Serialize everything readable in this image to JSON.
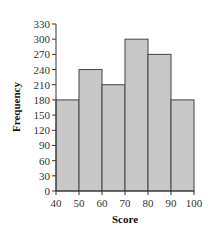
{
  "chart_data": {
    "type": "bar",
    "subtype": "histogram",
    "title": "",
    "xlabel": "Score",
    "ylabel": "Frequency",
    "bins": [
      [
        40,
        50
      ],
      [
        50,
        60
      ],
      [
        60,
        70
      ],
      [
        70,
        80
      ],
      [
        80,
        90
      ],
      [
        90,
        100
      ]
    ],
    "categories": [
      "40-50",
      "50-60",
      "60-70",
      "70-80",
      "80-90",
      "90-100"
    ],
    "values": [
      180,
      240,
      210,
      300,
      270,
      180
    ],
    "xlim": [
      40,
      100
    ],
    "ylim": [
      0,
      330
    ],
    "xticks": [
      40,
      50,
      60,
      70,
      80,
      90,
      100
    ],
    "yticks": [
      0,
      30,
      60,
      90,
      120,
      150,
      180,
      210,
      240,
      270,
      300,
      330
    ],
    "grid": false,
    "legend": null,
    "bar_color": "#c8c8c8",
    "edge_color": "#444444"
  }
}
